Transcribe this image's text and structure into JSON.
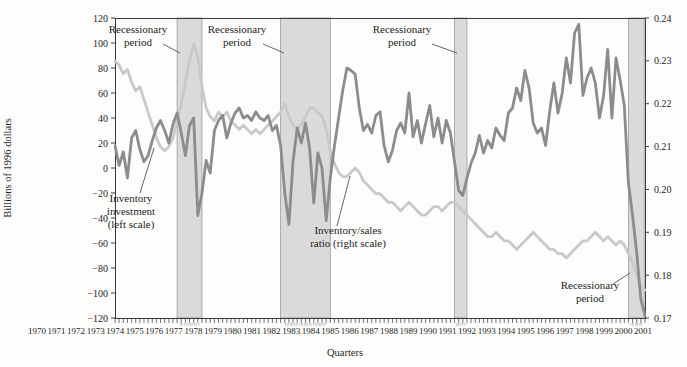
{
  "figure": {
    "type_note": "dual-axis quarterly line chart with shaded recession bands"
  },
  "chart_data": {
    "type": "line",
    "title": "",
    "xlabel": "Quarters",
    "ylabel_left": "Billions of 1996 dollars",
    "x_start": 1970,
    "x_step": 0.25,
    "x_end": 2002,
    "left_axis": {
      "min": -120,
      "max": 120,
      "step": 20,
      "tick_labels": [
        "120",
        "100",
        "80",
        "60",
        "40",
        "20",
        "0",
        "−20",
        "−40",
        "−60",
        "−80",
        "−100",
        "−120"
      ],
      "tick_values": [
        120,
        100,
        80,
        60,
        40,
        20,
        0,
        -20,
        -40,
        -60,
        -80,
        -100,
        -120
      ]
    },
    "right_axis": {
      "min": 0.17,
      "max": 0.24,
      "step": 0.01,
      "tick_labels": [
        "0.24",
        "0.23",
        "0.22",
        "0.21",
        "0.20",
        "0.19",
        "0.18",
        "0.17"
      ],
      "tick_values": [
        0.24,
        0.23,
        0.22,
        0.21,
        0.2,
        0.19,
        0.18,
        0.17
      ]
    },
    "year_labels": [
      "1970",
      "1971",
      "1972",
      "1973",
      "1974",
      "1975",
      "1976",
      "1977",
      "1978",
      "1979",
      "1980",
      "1981",
      "1982",
      "1983",
      "1984",
      "1985",
      "1986",
      "1987",
      "1988",
      "1989",
      "1990",
      "1991",
      "1992",
      "1993",
      "1994",
      "1995",
      "1996",
      "1997",
      "1998",
      "1999",
      "2000",
      "2001"
    ],
    "recession_bands": [
      {
        "label": "Recessionary period",
        "start": 1973.75,
        "end": 1975.25,
        "quarter_marks": "IV I II III IV I"
      },
      {
        "label": "Recessionary period",
        "start": 1980.0,
        "end": 1983.0,
        "quarter_marks": "I II III IV I II III IV I II III IV"
      },
      {
        "label": "Recessionary period",
        "start": 1990.5,
        "end": 1991.25,
        "quarter_marks": "III IV I"
      },
      {
        "label": "Recessionary period",
        "start": 2001.0,
        "end": 2001.95,
        "quarter_marks": "I II III IV"
      }
    ],
    "series": [
      {
        "name": "Inventory investment (left scale)",
        "axis": "left",
        "color": "#8c8c8c",
        "values": [
          18,
          2,
          13,
          -8,
          24,
          30,
          15,
          5,
          10,
          22,
          32,
          38,
          30,
          20,
          35,
          44,
          28,
          10,
          34,
          40,
          -38,
          -20,
          6,
          -4,
          30,
          38,
          42,
          24,
          36,
          44,
          48,
          40,
          42,
          38,
          45,
          40,
          38,
          42,
          30,
          34,
          18,
          -20,
          -45,
          5,
          32,
          20,
          36,
          16,
          -28,
          12,
          0,
          -42,
          -8,
          18,
          40,
          62,
          80,
          78,
          75,
          48,
          30,
          35,
          28,
          42,
          45,
          18,
          5,
          14,
          30,
          36,
          28,
          60,
          25,
          38,
          20,
          35,
          50,
          25,
          40,
          20,
          38,
          28,
          5,
          -18,
          -22,
          -8,
          4,
          12,
          26,
          12,
          22,
          16,
          32,
          26,
          22,
          44,
          48,
          64,
          54,
          78,
          64,
          36,
          28,
          32,
          18,
          46,
          68,
          44,
          60,
          88,
          68,
          108,
          115,
          58,
          72,
          80,
          68,
          40,
          58,
          95,
          40,
          88,
          70,
          50,
          -12,
          -38,
          -68,
          -105,
          -118
        ]
      },
      {
        "name": "Inventory/sales ratio (right scale)",
        "axis": "right",
        "color": "#c9c9c9",
        "values": [
          0.23,
          0.229,
          0.227,
          0.228,
          0.225,
          0.223,
          0.224,
          0.221,
          0.218,
          0.215,
          0.212,
          0.21,
          0.209,
          0.21,
          0.212,
          0.216,
          0.22,
          0.225,
          0.23,
          0.234,
          0.231,
          0.224,
          0.219,
          0.217,
          0.216,
          0.218,
          0.217,
          0.218,
          0.216,
          0.215,
          0.214,
          0.215,
          0.214,
          0.213,
          0.214,
          0.213,
          0.214,
          0.215,
          0.216,
          0.217,
          0.218,
          0.22,
          0.217,
          0.215,
          0.214,
          0.215,
          0.217,
          0.219,
          0.219,
          0.218,
          0.217,
          0.214,
          0.209,
          0.206,
          0.204,
          0.203,
          0.203,
          0.204,
          0.205,
          0.204,
          0.202,
          0.201,
          0.2,
          0.199,
          0.199,
          0.198,
          0.197,
          0.197,
          0.196,
          0.195,
          0.196,
          0.197,
          0.196,
          0.195,
          0.194,
          0.194,
          0.195,
          0.196,
          0.196,
          0.195,
          0.196,
          0.197,
          0.197,
          0.196,
          0.195,
          0.194,
          0.193,
          0.192,
          0.191,
          0.19,
          0.189,
          0.189,
          0.19,
          0.189,
          0.188,
          0.188,
          0.187,
          0.186,
          0.187,
          0.188,
          0.189,
          0.19,
          0.189,
          0.188,
          0.187,
          0.186,
          0.186,
          0.185,
          0.185,
          0.184,
          0.185,
          0.186,
          0.187,
          0.188,
          0.188,
          0.189,
          0.19,
          0.189,
          0.188,
          0.189,
          0.188,
          0.187,
          0.188,
          0.187,
          0.185,
          0.183,
          0.18,
          0.177,
          0.1765
        ]
      }
    ],
    "annotations": [
      {
        "id": "recession-label-1",
        "lines": [
          "Recessionary",
          "period"
        ]
      },
      {
        "id": "recession-label-2",
        "lines": [
          "Recessionary",
          "period"
        ]
      },
      {
        "id": "recession-label-3",
        "lines": [
          "Recessionary",
          "period"
        ]
      },
      {
        "id": "recession-label-4",
        "lines": [
          "Recessionary",
          "period"
        ]
      },
      {
        "id": "inventory-investment-label",
        "lines": [
          "Inventory",
          "investment",
          "(left scale)"
        ]
      },
      {
        "id": "inventory-sales-ratio-label",
        "lines": [
          "Inventory/sales",
          "ratio (right scale)"
        ]
      }
    ],
    "colors": {
      "investment_line": "#8c8c8c",
      "ratio_line": "#c9c9c9",
      "band_fill": "#dadada",
      "band_edge": "#9a9a9a",
      "axis": "#3a3a3a",
      "text": "#1d1d1d"
    },
    "legend_position": "none (labels annotated inside plot)",
    "grid": "off"
  }
}
